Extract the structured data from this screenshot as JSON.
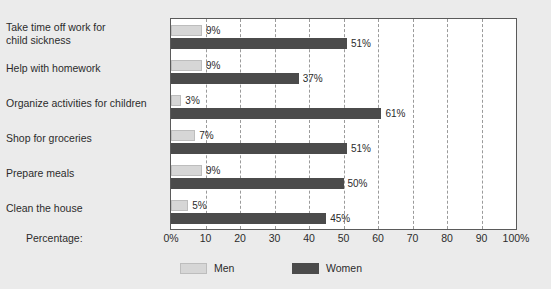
{
  "chart_data": {
    "type": "bar",
    "orientation": "horizontal",
    "title": "",
    "xlabel": "Percentage:",
    "ylabel": "",
    "xlim": [
      0,
      100
    ],
    "grid": true,
    "legend_position": "bottom",
    "categories": [
      "Take time off work for\nchild sickness",
      "Help with homework",
      "Organize activities for children",
      "Shop for groceries",
      "Prepare meals",
      "Clean the house"
    ],
    "xticks": [
      "0%",
      "10",
      "20",
      "30",
      "40",
      "50",
      "60",
      "70",
      "80",
      "90",
      "100%"
    ],
    "xtick_values": [
      0,
      10,
      20,
      30,
      40,
      50,
      60,
      70,
      80,
      90,
      100
    ],
    "series": [
      {
        "name": "Men",
        "color": "#d6d6d6",
        "values": [
          9,
          9,
          3,
          7,
          9,
          5
        ],
        "labels": [
          "9%",
          "9%",
          "3%",
          "7%",
          "9%",
          "5%"
        ]
      },
      {
        "name": "Women",
        "color": "#4b4b4b",
        "values": [
          51,
          37,
          61,
          51,
          50,
          45
        ],
        "labels": [
          "51%",
          "37%",
          "61%",
          "51%",
          "50%",
          "45%"
        ]
      }
    ]
  },
  "legend": {
    "items": [
      {
        "label": "Men",
        "swatch": "men"
      },
      {
        "label": "Women",
        "swatch": "women"
      }
    ]
  },
  "colors": {
    "background": "#ebebeb",
    "plot_background": "#ffffff",
    "plot_border": "#5a5a5a",
    "gridline": "#9a9a9a",
    "men_bar": "#d6d6d6",
    "women_bar": "#4b4b4b",
    "text": "#2b2b2b"
  }
}
